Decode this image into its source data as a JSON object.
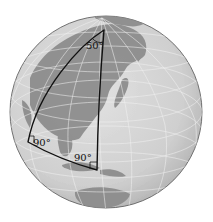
{
  "diagram": {
    "colors": {
      "ocean": "#d4d4d4",
      "land": "#8a8a8a",
      "grid": "#f2f2f2",
      "outline": "#111111",
      "rim": "#555555"
    },
    "angles": {
      "apex": "50°",
      "left": "90°",
      "right": "90°"
    }
  }
}
